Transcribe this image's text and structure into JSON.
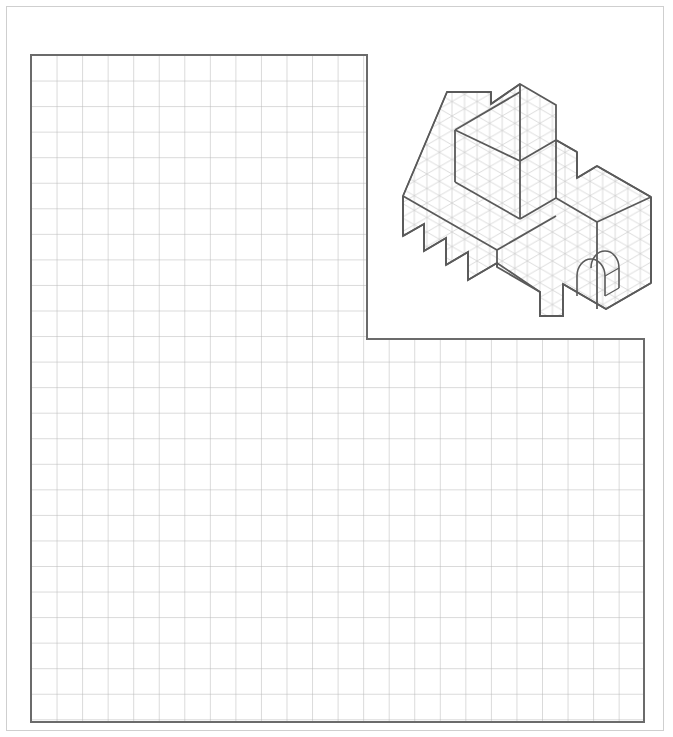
{
  "page": {
    "title": "Isometric drawing worksheet",
    "width": 673,
    "height": 737,
    "background_color": "#ffffff",
    "border_color": "#cfcfcf"
  },
  "grid": {
    "name": "square-grid-answer-area",
    "cell_size": 25.55,
    "minor_line_color": "#b6b6b6",
    "outline_color": "#6b6b6b",
    "outline_width": 2,
    "shape": "L-shaped",
    "upper_block": {
      "x": 31,
      "y": 55,
      "cols": 13,
      "rows": 11
    },
    "lower_block": {
      "x": 31,
      "y": 339,
      "cols": 24,
      "rows": 15
    },
    "left": 31,
    "top": 55,
    "right": 644,
    "bottom": 722,
    "notch_x": 367,
    "notch_y": 339
  },
  "figure": {
    "name": "isometric-solid-drawing",
    "line_color": "#5a5a5a",
    "outline_width": 1.8,
    "iso_grid_color": "#c3c3c3",
    "iso_grid_width": 0.6,
    "bounds": {
      "x": 403,
      "y": 84,
      "width": 248,
      "height": 232
    },
    "iso_unit": 14.5
  },
  "chart_data": {
    "type": "table",
    "title": "Isometric drawing worksheet",
    "categories": [
      "square grid answer area",
      "isometric solid pictorial"
    ],
    "values": [
      1,
      1
    ],
    "xlabel": "",
    "ylabel": "",
    "annotations": [
      "L-shaped square grid occupying lower-left of page",
      "Isometric solid rendered on triangular grid in upper-right of page"
    ]
  }
}
